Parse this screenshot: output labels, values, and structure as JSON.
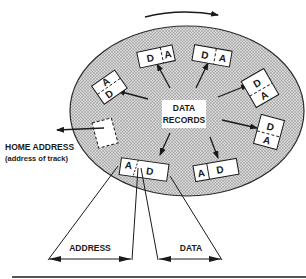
{
  "diagram": {
    "rotation_arrow": "clockwise rotation",
    "center_label": {
      "line1": "DATA",
      "line2": "RECORDS"
    },
    "home_address": {
      "title": "HOME ADDRESS",
      "subtitle": "(address of track)"
    },
    "measure_labels": {
      "address": "ADDRESS",
      "data": "DATA"
    },
    "records": [
      {
        "id": "r1",
        "a": "A",
        "d": "D"
      },
      {
        "id": "r2",
        "a": "A",
        "d": "D"
      },
      {
        "id": "r3",
        "a": "A",
        "d": "D"
      },
      {
        "id": "r4",
        "a": "A",
        "d": "D"
      },
      {
        "id": "r5",
        "a": "A",
        "d": "D"
      },
      {
        "id": "r6",
        "a": "A",
        "d": "D"
      },
      {
        "id": "r7",
        "a": "A",
        "d": "D"
      }
    ],
    "colors": {
      "track_fill": "#c8c8c8",
      "line": "#1a1a1a",
      "record_fill": "#ffffff"
    }
  }
}
